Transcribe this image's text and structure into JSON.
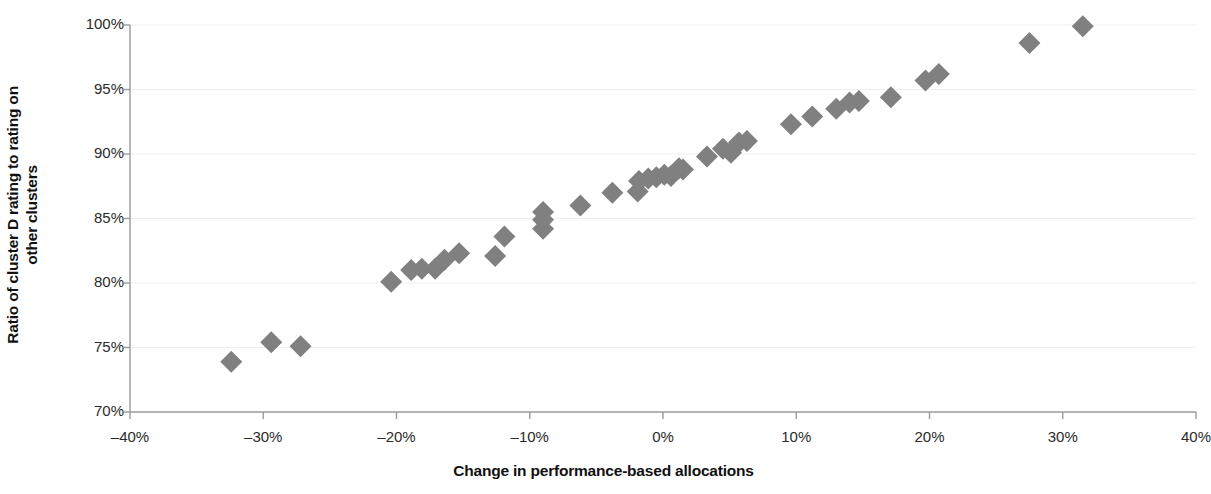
{
  "chart_data": {
    "type": "scatter",
    "title": "",
    "xlabel": "Change in performance-based allocations",
    "ylabel_line1": "Ratio of cluster D rating to rating on",
    "ylabel_line2": "other clusters",
    "xlim": [
      -40,
      40
    ],
    "ylim": [
      70,
      100
    ],
    "xticks": [
      -40,
      -30,
      -20,
      -10,
      0,
      10,
      20,
      30,
      40
    ],
    "xtick_labels": [
      "–40%",
      "–30%",
      "–20%",
      "–10%",
      "0%",
      "10%",
      "20%",
      "30%",
      "40%"
    ],
    "yticks": [
      70,
      75,
      80,
      85,
      90,
      95,
      100
    ],
    "ytick_labels": [
      "70%",
      "75%",
      "80%",
      "85%",
      "90%",
      "95%",
      "100%"
    ],
    "grid": true,
    "grid_axis": "y",
    "legend": "none",
    "marker": "diamond",
    "marker_color": "#808080",
    "marker_size": 11,
    "series": [
      {
        "name": "clusters",
        "points": [
          [
            -32.4,
            73.9
          ],
          [
            -29.4,
            75.4
          ],
          [
            -27.2,
            75.1
          ],
          [
            -20.4,
            80.1
          ],
          [
            -18.9,
            81.0
          ],
          [
            -18.1,
            81.1
          ],
          [
            -17.1,
            81.1
          ],
          [
            -16.4,
            81.8
          ],
          [
            -15.3,
            82.3
          ],
          [
            -12.6,
            82.1
          ],
          [
            -11.9,
            83.6
          ],
          [
            -9.0,
            85.5
          ],
          [
            -9.0,
            84.9
          ],
          [
            -9.0,
            84.2
          ],
          [
            -6.2,
            86.0
          ],
          [
            -3.8,
            87.0
          ],
          [
            -1.9,
            87.1
          ],
          [
            -1.8,
            87.9
          ],
          [
            -1.1,
            88.1
          ],
          [
            -0.5,
            88.2
          ],
          [
            0.1,
            88.4
          ],
          [
            0.6,
            88.3
          ],
          [
            1.2,
            88.9
          ],
          [
            1.5,
            88.8
          ],
          [
            3.3,
            89.8
          ],
          [
            4.5,
            90.4
          ],
          [
            5.1,
            90.1
          ],
          [
            5.7,
            90.9
          ],
          [
            6.3,
            91.0
          ],
          [
            9.6,
            92.3
          ],
          [
            11.2,
            92.9
          ],
          [
            13.0,
            93.5
          ],
          [
            14.0,
            94.0
          ],
          [
            14.7,
            94.1
          ],
          [
            17.1,
            94.4
          ],
          [
            19.7,
            95.7
          ],
          [
            20.7,
            96.2
          ],
          [
            27.5,
            98.6
          ],
          [
            31.5,
            99.9
          ]
        ]
      }
    ],
    "axis": {
      "line_color": "#9a9a9a",
      "grid_color": "#efefef",
      "tick_color": "#9a9a9a",
      "text_color": "#2a2a2a"
    },
    "plot_area": {
      "left": 130,
      "right": 1196,
      "top": 25,
      "bottom": 412
    }
  }
}
